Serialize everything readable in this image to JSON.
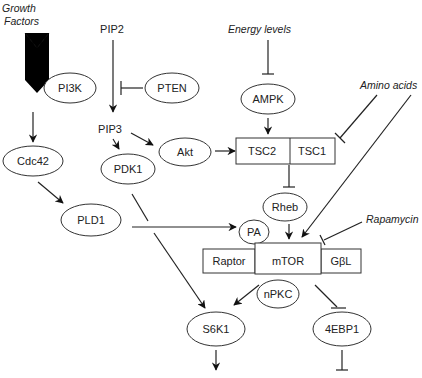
{
  "diagram": {
    "inputs": {
      "growth_factors_line1": "Growth",
      "growth_factors_line2": "Factors",
      "energy_levels": "Energy levels",
      "amino_acids": "Amino  acids",
      "rapamycin": "Rapamycin"
    },
    "nodes": {
      "pi3k": "PI3K",
      "pip2": "PIP2",
      "pten": "PTEN",
      "pip3": "PIP3",
      "akt": "Akt",
      "pdk1": "PDK1",
      "cdc42": "Cdc42",
      "pld1": "PLD1",
      "ampk": "AMPK",
      "tsc2": "TSC2",
      "tsc1": "TSC1",
      "rheb": "Rheb",
      "pa": "PA",
      "raptor": "Raptor",
      "mtor": "mTOR",
      "gbl": "GβL",
      "npkc": "nPKC",
      "s6k1": "S6K1",
      "4ebp1": "4EBP1"
    },
    "edges": [
      {
        "from": "Growth Factors",
        "to": "Cdc42",
        "type": "activate"
      },
      {
        "from": "PIP2",
        "to": "PIP3",
        "type": "activate"
      },
      {
        "from": "PTEN",
        "to": "PIP2-PIP3",
        "type": "inhibit"
      },
      {
        "from": "PIP3",
        "to": "PDK1",
        "type": "activate"
      },
      {
        "from": "PIP3",
        "to": "Akt",
        "type": "activate"
      },
      {
        "from": "Akt",
        "to": "TSC2",
        "type": "activate"
      },
      {
        "from": "Energy levels",
        "to": "AMPK",
        "type": "inhibit"
      },
      {
        "from": "AMPK",
        "to": "TSC2",
        "type": "activate"
      },
      {
        "from": "Amino acids",
        "to": "TSC1",
        "type": "inhibit"
      },
      {
        "from": "Amino acids",
        "to": "mTOR",
        "type": "activate"
      },
      {
        "from": "TSC2/TSC1",
        "to": "Rheb",
        "type": "inhibit"
      },
      {
        "from": "Rheb",
        "to": "mTOR",
        "type": "activate"
      },
      {
        "from": "Rapamycin",
        "to": "mTOR",
        "type": "inhibit"
      },
      {
        "from": "Cdc42",
        "to": "PLD1",
        "type": "activate"
      },
      {
        "from": "PLD1",
        "to": "PA",
        "type": "activate"
      },
      {
        "from": "PDK1",
        "to": "S6K1",
        "type": "activate"
      },
      {
        "from": "mTOR",
        "to": "S6K1",
        "type": "activate"
      },
      {
        "from": "mTOR",
        "to": "4EBP1",
        "type": "inhibit"
      },
      {
        "from": "S6K1",
        "to": "downstream",
        "type": "activate"
      },
      {
        "from": "4EBP1",
        "to": "downstream",
        "type": "inhibit"
      }
    ],
    "colors": {
      "stroke": "#222222",
      "growth_factor_arrow": "#000000",
      "background": "#ffffff"
    }
  }
}
